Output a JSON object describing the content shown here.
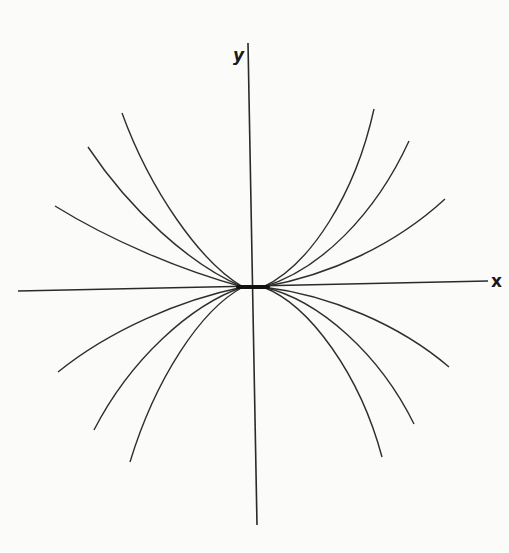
{
  "diagram": {
    "title": "",
    "type": "phase portrait (node)",
    "axes": {
      "x_label": "x",
      "y_label": "y",
      "x_axis": {
        "x1": 18,
        "y1": 291,
        "x2": 488,
        "y2": 281
      },
      "y_axis": {
        "x1": 248,
        "y1": 43,
        "x2": 257,
        "y2": 525
      }
    },
    "origin": {
      "x": 253,
      "y": 287
    },
    "colors": {
      "ink": "#2e2e2e",
      "background": "#fbfbfa"
    },
    "curves": [
      {
        "id": "ul-1",
        "d": "M 243 287 C 180 270, 110 240, 55 206"
      },
      {
        "id": "ul-2",
        "d": "M 243 287 C 190 265, 130 210, 88 147"
      },
      {
        "id": "ul-3",
        "d": "M 243 287 C 200 262, 150 190, 122 113"
      },
      {
        "id": "ur-1",
        "d": "M 263 287 C 330 275, 395 245, 445 199"
      },
      {
        "id": "ur-2",
        "d": "M 263 287 C 320 270, 375 215, 409 141"
      },
      {
        "id": "ur-3",
        "d": "M 263 287 C 310 265, 355 195, 374 109"
      },
      {
        "id": "ll-1",
        "d": "M 243 287 C 180 300, 110 330, 58 372"
      },
      {
        "id": "ll-2",
        "d": "M 243 287 C 190 305, 130 360, 94 430"
      },
      {
        "id": "ll-3",
        "d": "M 243 287 C 200 310, 155 380, 130 462"
      },
      {
        "id": "lr-1",
        "d": "M 263 287 C 330 295, 400 325, 449 367"
      },
      {
        "id": "lr-2",
        "d": "M 263 287 C 320 300, 380 355, 414 424"
      },
      {
        "id": "lr-3",
        "d": "M 263 287 C 310 305, 360 375, 382 457"
      }
    ],
    "center_segment": {
      "x1": 238,
      "y1": 287,
      "x2": 268,
      "y2": 287
    }
  }
}
